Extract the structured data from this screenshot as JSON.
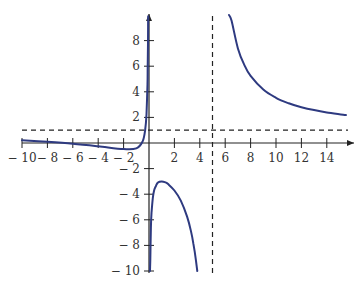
{
  "chart_data": {
    "type": "line",
    "title": "",
    "xlabel": "",
    "ylabel": "",
    "xlim": [
      -10,
      15.5
    ],
    "ylim": [
      -10,
      10
    ],
    "grid": false,
    "legend": null,
    "x_ticks": [
      -10,
      -8,
      -6,
      -4,
      -2,
      2,
      4,
      6,
      8,
      10,
      12,
      14
    ],
    "x_tick_labels": [
      "− 10",
      "− 8",
      "− 6",
      "− 4",
      "− 2",
      "2",
      "4",
      "6",
      "8",
      "10",
      "12",
      "14"
    ],
    "y_ticks": [
      8,
      6,
      4,
      2,
      -2,
      -4,
      -6,
      -8,
      -10
    ],
    "y_tick_labels": [
      "8",
      "6",
      "4",
      "2",
      "− 2",
      "− 4",
      "− 6",
      "− 8",
      "− 10"
    ],
    "asymptotes": {
      "vertical": [
        0,
        5
      ],
      "horizontal": [
        1
      ],
      "dashed_lines": [
        {
          "orientation": "vertical",
          "value": 5
        },
        {
          "orientation": "horizontal",
          "value": 1
        }
      ]
    },
    "series": [
      {
        "name": "left-branch",
        "color": "#2e3a80",
        "points": [
          [
            -10,
            0.21
          ],
          [
            -8,
            0.09
          ],
          [
            -6,
            -0.06
          ],
          [
            -4,
            -0.26
          ],
          [
            -2,
            -0.48
          ],
          [
            -1,
            -0.42
          ],
          [
            -0.5,
            0.14
          ],
          [
            -0.3,
            1.05
          ],
          [
            -0.2,
            2.25
          ],
          [
            -0.12,
            4.6
          ],
          [
            -0.1,
            5.95
          ],
          [
            -0.08,
            7.82
          ],
          [
            -0.07,
            9.15
          ],
          [
            -0.065,
            9.9
          ]
        ]
      },
      {
        "name": "middle-branch",
        "color": "#2e3a80",
        "points": [
          [
            0.075,
            -10
          ],
          [
            0.1,
            -9.15
          ],
          [
            0.15,
            -6.6
          ],
          [
            0.2,
            -5.46
          ],
          [
            0.3,
            -4.31
          ],
          [
            0.4,
            -3.7
          ],
          [
            0.55,
            -3.34
          ],
          [
            0.7,
            -3.09
          ],
          [
            1,
            -3.0
          ],
          [
            1.3,
            -3.08
          ],
          [
            1.5,
            -3.21
          ],
          [
            2,
            -3.71
          ],
          [
            2.5,
            -4.5
          ],
          [
            3,
            -5.75
          ],
          [
            3.3,
            -6.87
          ],
          [
            3.5,
            -7.88
          ],
          [
            3.7,
            -9.2
          ],
          [
            3.8,
            -10.0
          ]
        ]
      },
      {
        "name": "right-branch",
        "color": "#2e3a80",
        "points": [
          [
            6.3,
            10.0
          ],
          [
            6.5,
            9.55
          ],
          [
            7,
            7.39
          ],
          [
            7.5,
            6.1
          ],
          [
            8,
            5.24
          ],
          [
            9,
            4.17
          ],
          [
            10,
            3.53
          ],
          [
            11,
            3.1
          ],
          [
            12,
            2.79
          ],
          [
            13,
            2.57
          ],
          [
            14,
            2.39
          ],
          [
            15.5,
            2.19
          ]
        ]
      }
    ],
    "formula_approx": "y = 1 + 13/(x - 5) - 0.75/x"
  },
  "layout": {
    "origin_px": [
      149,
      143
    ],
    "px_per_unit_x": 12.7,
    "px_per_unit_y": 12.8,
    "axis_color": "#222222",
    "curve_color": "#2e3a80",
    "dash_color": "#222222"
  }
}
